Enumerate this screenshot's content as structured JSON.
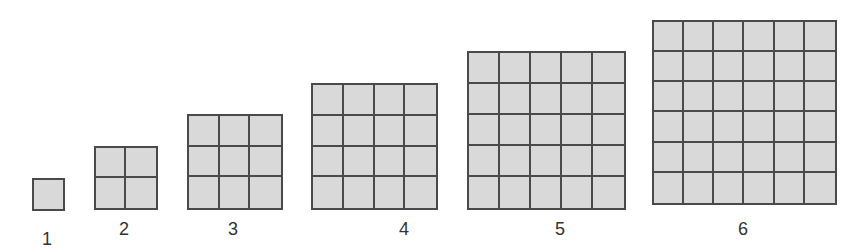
{
  "figure": {
    "fill_color": "#d9d9d9",
    "line_color": "#4a4a4a",
    "squares": [
      {
        "n": 1,
        "label": "1",
        "x": 32,
        "y": 178,
        "size": 33,
        "label_x": 47,
        "label_y": 230
      },
      {
        "n": 2,
        "label": "2",
        "x": 94,
        "y": 146,
        "size": 64,
        "label_x": 124,
        "label_y": 220
      },
      {
        "n": 3,
        "label": "3",
        "x": 187,
        "y": 114,
        "size": 96,
        "label_x": 233,
        "label_y": 220
      },
      {
        "n": 4,
        "label": "4",
        "x": 311,
        "y": 83,
        "size": 127,
        "label_x": 404,
        "label_y": 220
      },
      {
        "n": 5,
        "label": "5",
        "x": 467,
        "y": 51,
        "size": 159,
        "label_x": 560,
        "label_y": 220
      },
      {
        "n": 6,
        "label": "6",
        "x": 652,
        "y": 20,
        "size": 185,
        "label_x": 743,
        "label_y": 220
      }
    ]
  }
}
